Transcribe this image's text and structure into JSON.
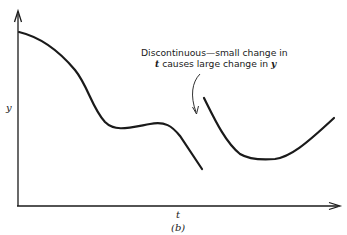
{
  "figure": {
    "caption": "(b)",
    "axes": {
      "x_label": "t",
      "y_label": "y"
    },
    "annotation": {
      "line1": "Discontinuous—small change in",
      "line2_var1": "t",
      "line2_mid": " causes large change in ",
      "line2_var2": "y"
    },
    "curves": [
      {
        "name": "left-segment",
        "description": "decreasing curve with plateau, ends before discontinuity"
      },
      {
        "name": "right-segment",
        "description": "U-shaped curve starting higher after jump"
      }
    ]
  }
}
